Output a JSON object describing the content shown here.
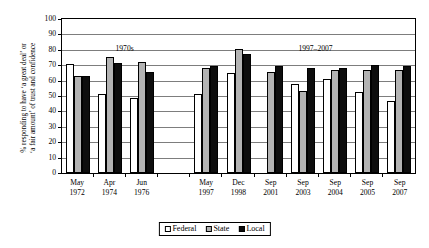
{
  "chart_data": {
    "type": "bar",
    "title": "",
    "xlabel": "",
    "ylabel_line1": "% responding to have ‘a great deal’ or",
    "ylabel_line2": "‘a fair amount’ of trust and confidence",
    "ylim": [
      0,
      100
    ],
    "ytick_step": 10,
    "yticks": [
      "100",
      "90",
      "80",
      "70",
      "60",
      "50",
      "40",
      "30",
      "20",
      "10",
      "0"
    ],
    "grid": true,
    "legend_position": "bottom-center",
    "categories": [
      "May 1972",
      "Apr 1974",
      "Jun 1976",
      "",
      "May 1997",
      "Dec 1998",
      "Sep 2001",
      "Sep 2003",
      "Sep 2004",
      "Sep 2005",
      "Sep 2007"
    ],
    "category_lines": [
      {
        "month": "May",
        "year": "1972"
      },
      {
        "month": "Apr",
        "year": "1974"
      },
      {
        "month": "Jun",
        "year": "1976"
      },
      {
        "month": "",
        "year": ""
      },
      {
        "month": "May",
        "year": "1997"
      },
      {
        "month": "Dec",
        "year": "1998"
      },
      {
        "month": "Sep",
        "year": "2001"
      },
      {
        "month": "Sep",
        "year": "2003"
      },
      {
        "month": "Sep",
        "year": "2004"
      },
      {
        "month": "Sep",
        "year": "2005"
      },
      {
        "month": "Sep",
        "year": "2007"
      }
    ],
    "series": [
      {
        "name": "Federal",
        "color": "#ffffff",
        "values": [
          70.5,
          51,
          49,
          null,
          51,
          65,
          null,
          58,
          61,
          52.5,
          46.5
        ]
      },
      {
        "name": "State",
        "color": "#b3b3b3",
        "values": [
          63,
          75.5,
          72,
          null,
          68.5,
          80.5,
          65.5,
          53,
          67,
          67,
          67
        ]
      },
      {
        "name": "Local",
        "color": "#0d0d0d",
        "values": [
          63,
          71.5,
          65.5,
          null,
          69.5,
          77.5,
          69.5,
          68.5,
          68.5,
          70,
          69.5
        ]
      }
    ],
    "annotations": [
      {
        "text": "1970s",
        "x_category_index": 1.45,
        "y": 84
      },
      {
        "text": "1997–2007",
        "x_category_index": 7.4,
        "y": 84
      }
    ],
    "legend": [
      {
        "label": "Federal",
        "swatch": "federal"
      },
      {
        "label": "State",
        "swatch": "state"
      },
      {
        "label": "Local",
        "swatch": "local"
      }
    ]
  }
}
